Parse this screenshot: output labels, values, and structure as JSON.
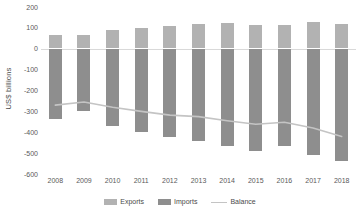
{
  "chart_data": {
    "type": "bar",
    "title": "",
    "xlabel": "",
    "ylabel": "US$ billions",
    "ylim": [
      -600,
      200
    ],
    "yticks": [
      200,
      100,
      0,
      -100,
      -200,
      -300,
      -400,
      -500,
      -600
    ],
    "ytick_labels": [
      "200",
      "100",
      "0",
      "-100",
      "-200",
      "-300",
      "-400",
      "-500",
      "-600"
    ],
    "grid": false,
    "legend_position": "bottom",
    "categories": [
      "2008",
      "2009",
      "2010",
      "2011",
      "2012",
      "2013",
      "2014",
      "2015",
      "2016",
      "2017",
      "2018"
    ],
    "series": [
      {
        "name": "Exports",
        "type": "bar",
        "color": "#b2b2b2",
        "values": [
          65,
          65,
          88,
          100,
          107,
          118,
          122,
          115,
          113,
          128,
          120
        ]
      },
      {
        "name": "Imports",
        "type": "bar",
        "color": "#8e8e8e",
        "values": [
          -335,
          -300,
          -368,
          -400,
          -425,
          -440,
          -468,
          -488,
          -468,
          -508,
          -540
        ]
      },
      {
        "name": "Balance",
        "type": "line",
        "color": "#c4c4c4",
        "values": [
          -270,
          -255,
          -280,
          -300,
          -318,
          -325,
          -345,
          -362,
          -352,
          -380,
          -420
        ]
      }
    ]
  },
  "title_sliver": {
    "text": ""
  },
  "legend": {
    "items": [
      {
        "label": "Exports",
        "swatch": "exports-swatch"
      },
      {
        "label": "Imports",
        "swatch": "imports-swatch"
      },
      {
        "label": "Balance",
        "swatch": "balance-line-swatch"
      }
    ]
  },
  "axis": {
    "y_title": "US$ billions"
  }
}
